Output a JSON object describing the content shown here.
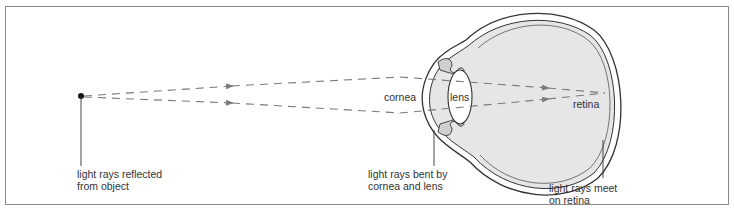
{
  "diagram": {
    "title": "",
    "type": "eye focusing light diagram",
    "colors": {
      "frame": "#8a8a8a",
      "ray": "#7a7a7a",
      "eye_fill": "#e6e6e6",
      "outline": "#333333",
      "text": "#333333",
      "object_dot": "#111111"
    },
    "labels": {
      "object": "light rays reflected\nfrom object",
      "cornea": "cornea",
      "lens": "lens",
      "retina": "retina",
      "bent": "light rays bent by\ncornea and lens",
      "meet": "light rays meet\non retina"
    },
    "parts": [
      "object point",
      "light rays",
      "cornea",
      "lens",
      "retina",
      "eyeball"
    ]
  }
}
